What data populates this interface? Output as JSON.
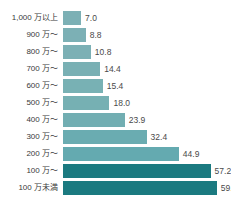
{
  "chart_data": {
    "type": "bar",
    "orientation": "horizontal",
    "title": "",
    "subtitle": "",
    "xlabel": "",
    "ylabel": "",
    "grid": false,
    "legend": "none",
    "xlim": [
      0,
      62
    ],
    "categories": [
      "1,000 万以上",
      "900 万～",
      "800 万～",
      "700 万～",
      "600 万～",
      "500 万～",
      "400 万～",
      "300 万～",
      "200 万～",
      "100 万～",
      "100 万未満"
    ],
    "values": [
      7.0,
      8.8,
      10.8,
      14.4,
      15.4,
      18.0,
      23.9,
      32.4,
      44.9,
      57.2,
      59.6
    ],
    "value_labels": [
      "7.0",
      "8.8",
      "10.8",
      "14.4",
      "15.4",
      "18.0",
      "23.9",
      "32.4",
      "44.9",
      "57.2",
      "59.6"
    ],
    "bar_colors": [
      "#7cb0b5",
      "#7cb0b5",
      "#7cb0b5",
      "#79b0b4",
      "#78b1b4",
      "#76b0b3",
      "#72aeb2",
      "#6aacb1",
      "#64aab0",
      "#1b7a80",
      "#1b7a80"
    ],
    "colors": {
      "light_bar": "#7cb0b5",
      "dark_bar": "#1b7a80",
      "background": "#ffffff",
      "label_text": "#3a3a3a",
      "value_text": "#4a4a4a"
    }
  }
}
